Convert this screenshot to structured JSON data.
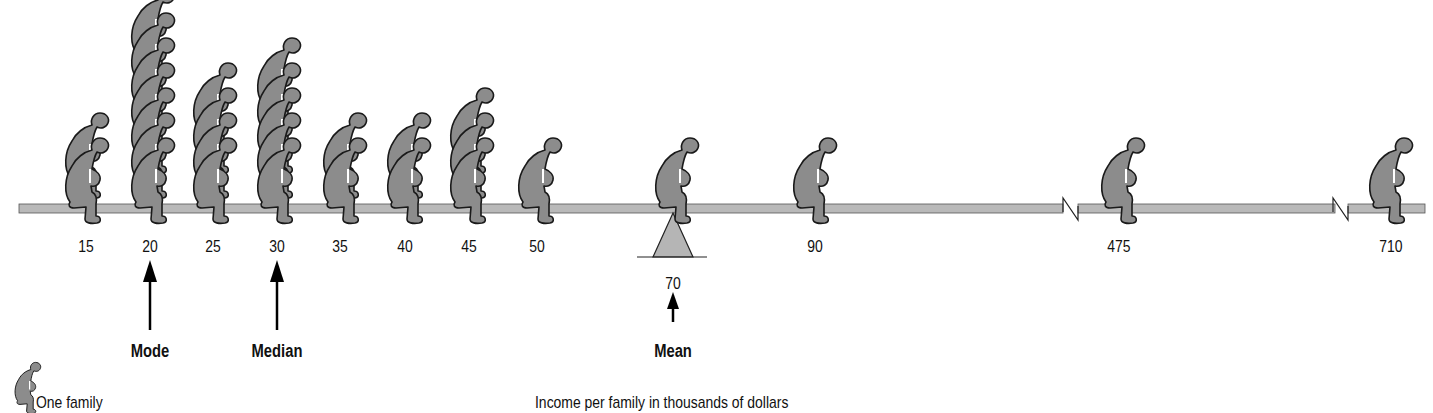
{
  "chart_data": {
    "type": "pictograph",
    "title": "",
    "xlabel": "Income per family in thousands of dollars",
    "legend": [
      {
        "icon": "seated-person-icon",
        "label": "One family"
      }
    ],
    "categories": [
      "15",
      "20",
      "25",
      "30",
      "35",
      "40",
      "45",
      "50",
      "70",
      "90",
      "475",
      "710"
    ],
    "values": [
      2,
      7,
      4,
      5,
      2,
      2,
      3,
      1,
      1,
      1,
      1,
      1
    ],
    "total_families": 30,
    "axis_breaks": [
      "between 90 and 475",
      "between 475 and 710"
    ],
    "annotations": [
      {
        "label": "Mode",
        "value": 20
      },
      {
        "label": "Median",
        "value": 30
      },
      {
        "label": "Mean",
        "value": 70,
        "marker": "fulcrum"
      }
    ]
  },
  "labels": {
    "ticks": [
      "15",
      "20",
      "25",
      "30",
      "35",
      "40",
      "45",
      "50",
      "90",
      "475",
      "710"
    ],
    "mean_value": "70",
    "mode": "Mode",
    "median": "Median",
    "mean": "Mean",
    "legend": "One family",
    "xlabel": "Income per family in thousands of dollars"
  },
  "colors": {
    "figure_fill": "#8c8c8c",
    "figure_stroke": "#1a1a1a",
    "beam_fill": "#b9b9b9",
    "fulcrum_fill": "#b5b5b5",
    "text": "#111111"
  }
}
